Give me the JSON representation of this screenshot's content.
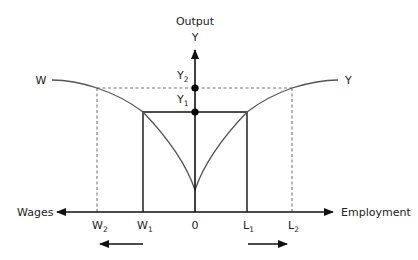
{
  "diagram": {
    "type": "four-quadrant economic diagram",
    "y_axis": {
      "title": "Output",
      "symbol": "Y"
    },
    "x_axis_left": {
      "label": "Wages"
    },
    "x_axis_right": {
      "label": "Employment"
    },
    "origin_label": "0",
    "curves": [
      {
        "id": "W",
        "label": "W",
        "description": "wage curve (left)"
      },
      {
        "id": "Y",
        "label": "Y",
        "description": "output curve (right)"
      }
    ],
    "points": {
      "Y1": {
        "base": "Y",
        "sub": "1"
      },
      "Y2": {
        "base": "Y",
        "sub": "2"
      },
      "W1": {
        "base": "W",
        "sub": "1"
      },
      "W2": {
        "base": "W",
        "sub": "2"
      },
      "L1": {
        "base": "L",
        "sub": "1"
      },
      "L2": {
        "base": "L",
        "sub": "2"
      }
    },
    "shift_arrows": [
      {
        "direction": "left",
        "meaning": "wages shift from W1 to W2"
      },
      {
        "direction": "right",
        "meaning": "employment shifts from L1 to L2"
      }
    ],
    "colors": {
      "axis": "#111111",
      "curve": "#555555",
      "dashed": "#777777",
      "dot": "#000000"
    }
  }
}
